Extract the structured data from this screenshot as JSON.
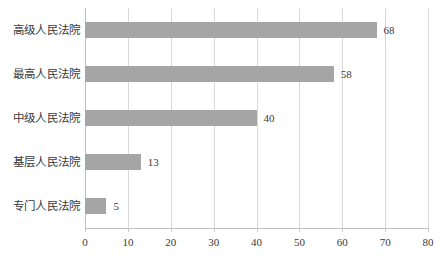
{
  "chart_data": {
    "type": "bar",
    "orientation": "horizontal",
    "title": "",
    "subtitle": "",
    "xlabel": "",
    "ylabel": "",
    "categories": [
      "高级人民法院",
      "最高人民法院",
      "中级人民法院",
      "基层人民法院",
      "专门人民法院"
    ],
    "values": [
      68,
      58,
      40,
      13,
      5
    ],
    "data_labels": [
      "68",
      "58",
      "40",
      "13",
      "5"
    ],
    "xlim": [
      0,
      80
    ],
    "xticks": [
      0,
      10,
      20,
      30,
      40,
      50,
      60,
      70,
      80
    ],
    "xtick_labels": [
      "0",
      "10",
      "20",
      "30",
      "40",
      "50",
      "60",
      "70",
      "80"
    ],
    "grid": "vertical",
    "legend": "none",
    "series": [
      {
        "name": "",
        "values": [
          68,
          58,
          40,
          13,
          5
        ]
      }
    ],
    "colors": {
      "bar": "#a5a5a5",
      "gridline": "#d9d9d9",
      "axis": "#bfbfbf",
      "text": "#3a3a3a",
      "background": "#ffffff"
    }
  }
}
